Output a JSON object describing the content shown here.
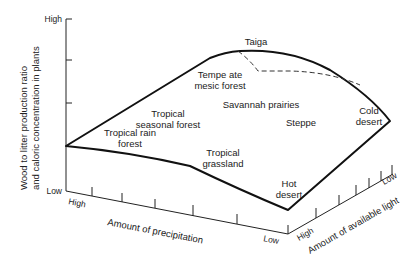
{
  "diagram": {
    "y_axis": {
      "label_line1": "Wood to litter production ratio",
      "label_line2": "and caloric concentration in plants",
      "high": "High",
      "low": "Low"
    },
    "x_axis": {
      "label": "Amount of precipitation",
      "high": "High",
      "low": "Low"
    },
    "z_axis": {
      "label": "Amount of available light",
      "high": "High",
      "low": "Low"
    },
    "biomes": {
      "taiga": "Taiga",
      "temperate_1": "Tempe ate",
      "temperate_2": "mesic forest",
      "trop_seasonal_1": "Tropical",
      "trop_seasonal_2": "seasonal forest",
      "savannah": "Savannah prairies",
      "steppe": "Steppe",
      "cold_desert_1": "Cold",
      "cold_desert_2": "desert",
      "rain_1": "Tropical rain",
      "rain_2": "forest",
      "grassland_1": "Tropical",
      "grassland_2": "grassland",
      "hot_desert_1": "Hot",
      "hot_desert_2": "desert"
    }
  }
}
